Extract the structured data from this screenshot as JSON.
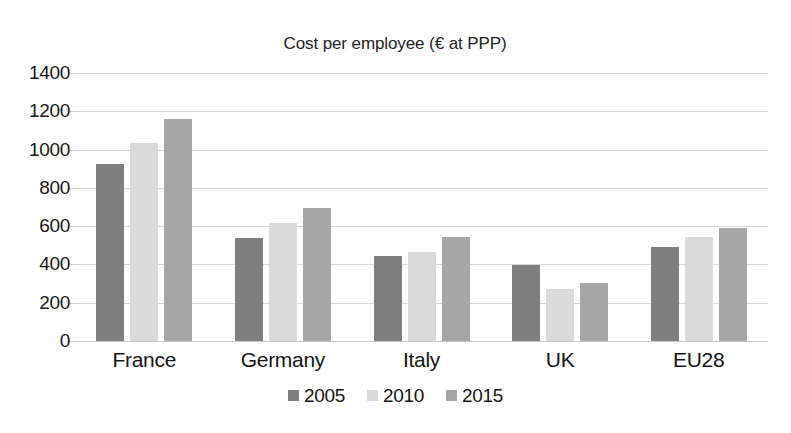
{
  "chart_data": {
    "type": "bar",
    "title": "Cost per employee (€ at PPP)",
    "xlabel": "",
    "ylabel": "",
    "categories": [
      "France",
      "Germany",
      "Italy",
      "UK",
      "EU28"
    ],
    "series": [
      {
        "name": "2005",
        "color": "#7f7f7f",
        "values": [
          925,
          540,
          445,
          395,
          490
        ]
      },
      {
        "name": "2010",
        "color": "#d9d9d9",
        "values": [
          1035,
          615,
          465,
          270,
          545
        ]
      },
      {
        "name": "2015",
        "color": "#a6a6a6",
        "values": [
          1160,
          695,
          545,
          305,
          590
        ]
      }
    ],
    "ylim": [
      0,
      1400
    ],
    "ytick_step": 200,
    "yticks": [
      "1400",
      "1200",
      "1000",
      "800",
      "600",
      "400",
      "200",
      "0"
    ],
    "grid": true,
    "grid_axis": "y",
    "legend_position": "bottom-center",
    "bar_orientation": "vertical",
    "grouping": "grouped"
  },
  "colors": {
    "background": "#ffffff",
    "gridline": "#d6d6d6",
    "axis": "#c9c9c9",
    "text": "#171717"
  }
}
